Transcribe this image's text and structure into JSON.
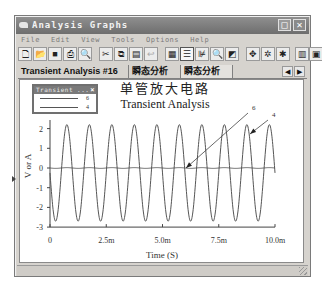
{
  "window": {
    "title": "Analysis Graphs",
    "controls": {
      "maximize": "□",
      "close": "✕"
    }
  },
  "menubar": {
    "items": [
      {
        "label": "File"
      },
      {
        "label": "Edit"
      },
      {
        "label": "View"
      },
      {
        "label": "Tools"
      },
      {
        "label": "Options"
      },
      {
        "label": "Help"
      }
    ]
  },
  "toolbar": {
    "buttons": [
      {
        "name": "new-icon",
        "glyph": "🗋",
        "x": 0
      },
      {
        "name": "open-icon",
        "glyph": "📂",
        "x": 15
      },
      {
        "name": "save-icon",
        "glyph": "■",
        "x": 30
      },
      {
        "name": "print-icon",
        "glyph": "⎙",
        "x": 45
      },
      {
        "name": "print-preview-icon",
        "glyph": "🔍",
        "x": 60
      },
      {
        "name": "cut-icon",
        "glyph": "✂",
        "x": 81
      },
      {
        "name": "copy-icon",
        "glyph": "⧉",
        "x": 96
      },
      {
        "name": "paste-icon",
        "glyph": "▤",
        "x": 111
      },
      {
        "name": "undo-icon",
        "glyph": "↩",
        "x": 126,
        "disabled": true
      },
      {
        "name": "grid-icon",
        "glyph": "▦",
        "x": 147
      },
      {
        "name": "legend-toggle-icon",
        "glyph": "☰",
        "x": 162,
        "pressed": true
      },
      {
        "name": "cursors-icon",
        "glyph": "⊯",
        "x": 177
      },
      {
        "name": "zoom-icon",
        "glyph": "🔍",
        "x": 192,
        "disabled": true
      },
      {
        "name": "overlay-icon",
        "glyph": "◩",
        "x": 207
      },
      {
        "name": "reverse-colors-icon",
        "glyph": "✥",
        "x": 228
      },
      {
        "name": "select-marks-icon",
        "glyph": "✲",
        "x": 243
      },
      {
        "name": "properties-icon",
        "glyph": "✱",
        "x": 258
      },
      {
        "name": "export-excel-icon",
        "glyph": "▥",
        "x": 277
      },
      {
        "name": "export-mathcad-icon",
        "glyph": "▣",
        "x": 291
      }
    ]
  },
  "tabs": [
    {
      "label": "Transient Analysis #16",
      "active": false
    },
    {
      "label": "瞬态分析",
      "active": false
    },
    {
      "label": "瞬态分析",
      "active": true
    }
  ],
  "tab_nav": {
    "prev": "◀",
    "next": "▶"
  },
  "legend": {
    "title": "Transient ...",
    "close": "×",
    "entries": [
      {
        "label": "6"
      },
      {
        "label": "4"
      }
    ]
  },
  "chart_data": {
    "type": "line",
    "title": "单管放大电路",
    "subtitle": "Transient Analysis",
    "xlabel": "Time (S)",
    "ylabel": "V or A",
    "xlim": [
      0,
      0.01
    ],
    "ylim": [
      -3,
      2.6
    ],
    "x_ticks": [
      "0",
      "2.5m",
      "5.0m",
      "7.5m",
      "10.0m"
    ],
    "y_ticks": [
      "2",
      "1",
      "0",
      "-1",
      "-2",
      "-3"
    ],
    "grid": false,
    "legend_position": "top-left floating",
    "series": [
      {
        "name": "6",
        "description": "near-zero trace (~0 V, flat line)",
        "amplitude": 0.02,
        "offset": 0.0,
        "frequency_hz": 1000
      },
      {
        "name": "4",
        "description": "sine output, 10 cycles over 10 ms",
        "amplitude": 2.45,
        "offset": -0.25,
        "frequency_hz": 1000,
        "phase": "starts at 0 going negative",
        "max": 2.2,
        "min": -2.7
      }
    ],
    "annotations": [
      {
        "label": "6",
        "points_to": "flat trace at ~5.6 ms, 0 V"
      },
      {
        "label": "4",
        "points_to": "sine peak at ~8.8 ms"
      }
    ]
  }
}
